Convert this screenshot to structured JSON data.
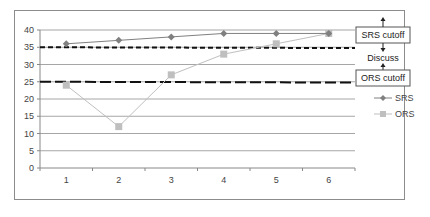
{
  "chart_data": {
    "type": "line",
    "title": "",
    "xlabel": "",
    "ylabel": "",
    "categories": [
      "1",
      "2",
      "3",
      "4",
      "5",
      "6"
    ],
    "series": [
      {
        "name": "SRS",
        "marker": "diamond",
        "color": "#808080",
        "values": [
          36,
          37,
          38,
          39,
          39,
          39
        ]
      },
      {
        "name": "ORS",
        "marker": "square",
        "color": "#bfbfbf",
        "values": [
          24,
          12,
          27,
          33,
          36,
          39
        ]
      }
    ],
    "reference_lines": [
      {
        "label": "SRS cutoff",
        "value": 35,
        "style": "short-dash"
      },
      {
        "label": "ORS cutoff",
        "value": 25,
        "style": "long-dash"
      }
    ],
    "annotations": [
      "SRS cutoff",
      "Discuss",
      "ORS cutoff"
    ],
    "ylim": [
      0,
      40
    ],
    "yticks": [
      0,
      5,
      10,
      15,
      20,
      25,
      30,
      35,
      40
    ],
    "grid": true,
    "legend_position": "right"
  },
  "labels": {
    "srs_cutoff": "SRS cutoff",
    "discuss": "Discuss",
    "ors_cutoff": "ORS cutoff",
    "legend_srs": "SRS",
    "legend_ors": "ORS"
  }
}
